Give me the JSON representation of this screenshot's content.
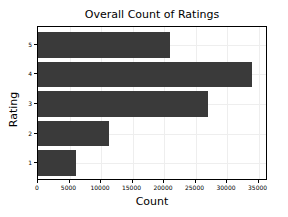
{
  "chart_data": {
    "type": "bar",
    "orientation": "horizontal",
    "title": "Overall Count of Ratings",
    "xlabel": "Count",
    "ylabel": "Rating",
    "categories": [
      "1",
      "2",
      "3",
      "4",
      "5"
    ],
    "values": [
      6000,
      11200,
      27000,
      34000,
      21000
    ],
    "xlim": [
      0,
      36500
    ],
    "ylim": [
      0.4,
      5.6
    ],
    "xticks": [
      0,
      5000,
      10000,
      15000,
      20000,
      25000,
      30000,
      35000
    ],
    "xtick_labels": [
      "0",
      "5000",
      "10000",
      "15000",
      "20000",
      "25000",
      "30000",
      "35000"
    ],
    "yticks": [
      1,
      2,
      3,
      4,
      5
    ],
    "ytick_labels": [
      "1",
      "2",
      "3",
      "4",
      "5"
    ],
    "grid": true,
    "legend": null,
    "bar_color": "#3a3a3a",
    "grid_color": "#eeeeee",
    "axes_color": "#000000",
    "background_color": "#ffffff"
  }
}
